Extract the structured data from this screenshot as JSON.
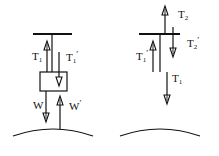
{
  "diagram": {
    "left_panel": {
      "labels": {
        "t1": "T",
        "t1_sub": "1",
        "t1p": "T",
        "t1p_sub": "1",
        "t1p_prime": "′",
        "w": "W",
        "wp": "W",
        "wp_prime": "′"
      }
    },
    "right_panel": {
      "labels": {
        "t2": "T",
        "t2_sub": "2",
        "t2p": "T",
        "t2p_sub": "2",
        "t2p_prime": "′",
        "t1p": "T",
        "t1p_sub": "1",
        "t1p_prime": "′",
        "t1": "T",
        "t1_sub": "1"
      }
    },
    "colors": {
      "ink": "#111111",
      "background": "#ffffff"
    }
  }
}
